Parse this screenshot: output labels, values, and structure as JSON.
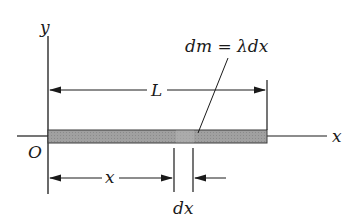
{
  "diagram": {
    "axes": {
      "x_label": "x",
      "y_label": "y",
      "origin_label": "O"
    },
    "dimensions": {
      "length_label": "L",
      "position_label": "x",
      "element_label": "dx"
    },
    "annotation": {
      "mass_element": "dm = λdx"
    },
    "colors": {
      "line": "#1a1a1a",
      "rod_fill": "#9a9a9a",
      "rod_edge": "#3a3a3a",
      "element_fill": "#b4b4b4"
    }
  }
}
